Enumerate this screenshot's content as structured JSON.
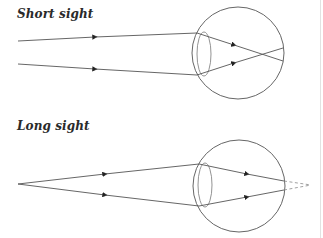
{
  "panels": [
    {
      "id": "short-sight",
      "title": "Short sight",
      "eye": {
        "cx": 238,
        "cy": 53,
        "r": 46
      },
      "lens": {
        "cx": 204,
        "cy": 54,
        "rx": 7,
        "ry": 22
      },
      "rays": [
        {
          "outside": [
            [
              18,
              41
            ],
            [
              197,
              33
            ]
          ],
          "inside": [
            [
              197,
              33
            ],
            [
              283,
              61
            ]
          ],
          "arrow_out": [
            95,
            37
          ],
          "arrow_in": [
            234,
            45
          ]
        },
        {
          "outside": [
            [
              18,
              64
            ],
            [
              197,
              75
            ]
          ],
          "inside": [
            [
              197,
              75
            ],
            [
              283,
              48
            ]
          ],
          "arrow_out": [
            95,
            69
          ],
          "arrow_in": [
            234,
            63
          ]
        }
      ],
      "focus_note": "rays cross before reaching the retina"
    },
    {
      "id": "long-sight",
      "title": "Long sight",
      "eye": {
        "cx": 239,
        "cy": 186,
        "r": 46
      },
      "lens": {
        "cx": 205,
        "cy": 185,
        "rx": 7,
        "ry": 22
      },
      "rays": [
        {
          "outside": [
            [
              18,
              184
            ],
            [
              199,
              164
            ]
          ],
          "inside": [
            [
              199,
              164
            ],
            [
              284,
              181
            ]
          ],
          "arrow_out": [
            105,
            174
          ],
          "arrow_in": [
            247,
            174
          ],
          "dashed": [
            [
              284,
              181
            ],
            [
              311,
              185
            ]
          ]
        },
        {
          "outside": [
            [
              18,
              184
            ],
            [
              199,
              206
            ]
          ],
          "inside": [
            [
              199,
              206
            ],
            [
              284,
              190
            ]
          ],
          "arrow_out": [
            105,
            195
          ],
          "arrow_in": [
            247,
            197
          ],
          "dashed": [
            [
              284,
              190
            ],
            [
              311,
              185
            ]
          ]
        }
      ],
      "focus_note": "rays would focus behind the retina"
    }
  ],
  "colors": {
    "line": "#555555",
    "arrow": "#222222",
    "title": "#2a2a2a"
  }
}
